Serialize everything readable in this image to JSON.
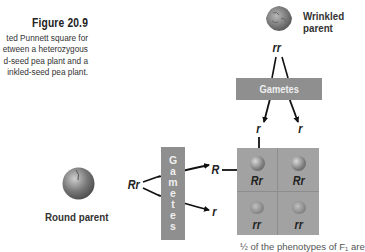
{
  "figure": {
    "title": "Figure 20.9",
    "caption_lines": [
      "ted Punnett square for",
      "etween a heterozygous",
      "d-seed pea plant and a",
      "inkled-seed pea plant."
    ]
  },
  "wrinkled_parent": {
    "label_line1": "Wrinkled",
    "label_line2": "parent",
    "genotype": "rr",
    "icon": "wrinkled-pea-icon"
  },
  "round_parent": {
    "label": "Round parent",
    "genotype": "Rr",
    "icon": "round-pea-icon"
  },
  "gametes_top": {
    "label": "Gametes",
    "alleles": [
      "r",
      "r"
    ]
  },
  "gametes_left": {
    "label_letters": [
      "G",
      "a",
      "m",
      "e",
      "t",
      "e",
      "s"
    ],
    "alleles": [
      "R",
      "r"
    ]
  },
  "punnett": {
    "cells": [
      {
        "genotype": "Rr",
        "phenotype": "round"
      },
      {
        "genotype": "Rr",
        "phenotype": "round"
      },
      {
        "genotype": "rr",
        "phenotype": "wrinkled"
      },
      {
        "genotype": "rr",
        "phenotype": "wrinkled"
      }
    ]
  },
  "footer_text": "½ of the phenotypes of F₁ are",
  "colors": {
    "gametes_box": "#8f8f8f",
    "grid": "#a2a2a2",
    "text": "#222222"
  }
}
